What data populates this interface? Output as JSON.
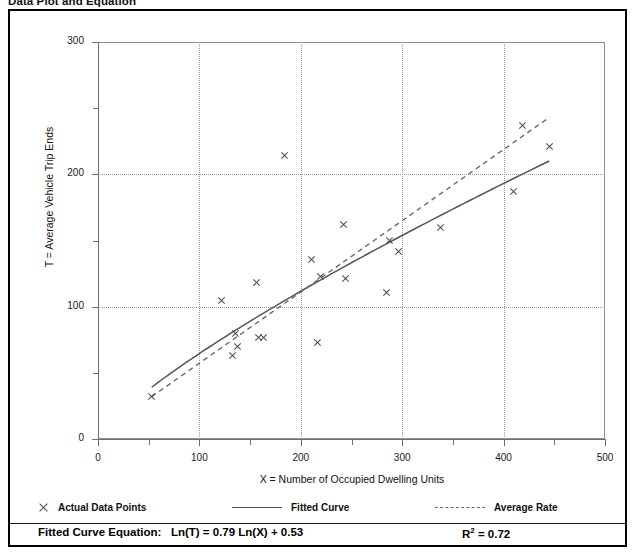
{
  "page_title": "Data Plot and Equation",
  "chart_data": {
    "type": "scatter",
    "title": "Data Plot and Equation",
    "xlabel": "X = Number of Occupied Dwelling Units",
    "ylabel": "T = Average Vehicle Trip Ends",
    "xlim": [
      0,
      500
    ],
    "ylim": [
      0,
      300
    ],
    "xticks": [
      0,
      100,
      200,
      300,
      400,
      500
    ],
    "yticks": [
      0,
      100,
      200,
      300
    ],
    "x_minor_ticks": [
      50,
      150,
      250,
      350,
      450
    ],
    "y_minor_ticks": [
      50,
      150,
      250
    ],
    "grid": "dotted gridlines at major ticks",
    "legend_position": "below plot",
    "series": [
      {
        "name": "Actual Data Points",
        "marker": "x",
        "points": [
          [
            53,
            32
          ],
          [
            122,
            105
          ],
          [
            133,
            63
          ],
          [
            136,
            80
          ],
          [
            138,
            70
          ],
          [
            156,
            118
          ],
          [
            158,
            77
          ],
          [
            163,
            77
          ],
          [
            184,
            214
          ],
          [
            211,
            136
          ],
          [
            216,
            73
          ],
          [
            219,
            123
          ],
          [
            242,
            162
          ],
          [
            244,
            121
          ],
          [
            285,
            111
          ],
          [
            287,
            150
          ],
          [
            296,
            142
          ],
          [
            338,
            160
          ],
          [
            410,
            187
          ],
          [
            419,
            237
          ],
          [
            445,
            221
          ]
        ]
      },
      {
        "name": "Fitted Curve",
        "style": "solid",
        "equation": "Ln(T) = 0.79 Ln(X) + 0.53",
        "endpoints_x": [
          53,
          445
        ]
      },
      {
        "name": "Average Rate",
        "style": "dashed",
        "endpoints": [
          [
            53,
            32
          ],
          [
            445,
            243
          ]
        ]
      }
    ],
    "annotations": {
      "equation_label": "Fitted Curve Equation:",
      "equation": "Ln(T) = 0.79 Ln(X) + 0.53",
      "r_squared_symbol": "R",
      "r_squared_exponent": "2",
      "r_squared_value": "= 0.72"
    }
  },
  "axes": {
    "y_title": "T = Average Vehicle Trip Ends",
    "x_title": "X = Number of Occupied Dwelling Units",
    "y_labels": [
      "300",
      "200",
      "100",
      "0"
    ],
    "x_labels": [
      "0",
      "100",
      "200",
      "300",
      "400",
      "500"
    ]
  },
  "legend": {
    "items": [
      {
        "label": "Actual Data Points",
        "marker": "x-marker"
      },
      {
        "label": "Fitted Curve",
        "marker": "solid-line"
      },
      {
        "label": "Average Rate",
        "marker": "dashed-line"
      }
    ]
  },
  "equation_bar": {
    "label": "Fitted Curve Equation:",
    "formula": "Ln(T) = 0.79 Ln(X) + 0.53",
    "r2_base": "R",
    "r2_exp": "2",
    "r2_value": "= 0.72"
  }
}
